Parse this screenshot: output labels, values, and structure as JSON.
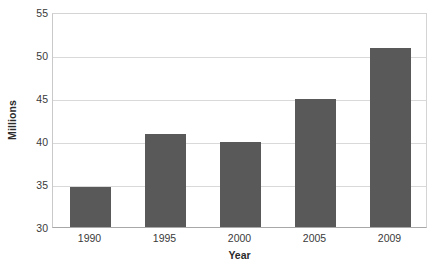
{
  "chart_data": {
    "type": "bar",
    "title": "",
    "subtitle": "",
    "categories": [
      "1990",
      "1995",
      "2000",
      "2005",
      "2009"
    ],
    "values": [
      34.7,
      40.8,
      39.9,
      44.9,
      50.8
    ],
    "xlabel": "Year",
    "ylabel": "Millions",
    "ylim": [
      30,
      55
    ],
    "yticks": [
      30,
      35,
      40,
      45,
      50,
      55
    ],
    "ytick_labels": [
      "30",
      "35",
      "40",
      "45",
      "50",
      "55"
    ],
    "grid": true,
    "grid_axis": "y",
    "legend": false,
    "legend_position": "none",
    "annotations": [],
    "colors": {
      "bar": "#595959",
      "gridline": "#d9d9d9",
      "axis": "#a8a8a8",
      "plot_background": "#ffffff",
      "figure_background": "#ffffff",
      "text": "#3a3a3a",
      "title_text": "#2b2b2b"
    }
  }
}
